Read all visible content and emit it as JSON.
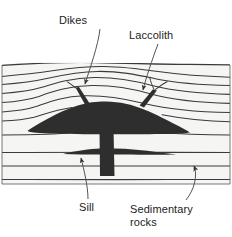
{
  "figure": {
    "type": "geologic-cross-section",
    "background_color": "#ffffff"
  },
  "colors": {
    "intrusion_fill": "#2e2e2e",
    "strata_line": "#3a3a3a",
    "block_fill": "#f4f4f2",
    "leader_line": "#4a4a4a",
    "text": "#1c1c1c"
  },
  "labels": [
    {
      "id": "dikes",
      "text": "Dikes",
      "points_to": "thin vertical intrusions rising from the top of the laccolith"
    },
    {
      "id": "laccolith",
      "text": "Laccolith",
      "points_to": "mushroom-shaped igneous intrusion doming the overlying strata"
    },
    {
      "id": "sill",
      "text": "Sill",
      "points_to": "horizontal tabular intrusion concordant with bedding"
    },
    {
      "id": "sedimentary_rocks",
      "line1": "Sedimentary",
      "line2": "rocks",
      "points_to": "layered bedding planes of the host rock"
    }
  ],
  "features": {
    "laccolith": {
      "name": "Laccolith",
      "description": "Broad dome-shaped magma body with flat floor, arching the strata above it"
    },
    "dikes": {
      "name": "Dikes",
      "count": 2,
      "description": "Narrow discordant intrusions cutting upward across bedding from the laccolith roof"
    },
    "feeder_dike": {
      "name": "Feeder dike",
      "description": "Vertical conduit below the laccolith supplying magma from depth"
    },
    "sill": {
      "name": "Sill",
      "description": "Thin concordant sheet spreading laterally along a bedding plane from the feeder dike"
    },
    "sedimentary_rocks": {
      "name": "Sedimentary rocks",
      "bed_count": 11,
      "description": "Stratified host rock; upper beds domed over the intrusion, lower beds flat-lying"
    }
  }
}
